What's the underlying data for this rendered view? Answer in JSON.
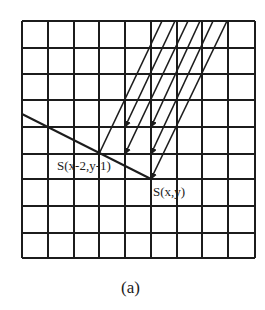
{
  "figure": {
    "caption": "(a)",
    "grid": {
      "rows": 9,
      "cols": 9,
      "x_lines": [
        22,
        48,
        74,
        99,
        125,
        151,
        177,
        202,
        228,
        255
      ],
      "y_lines": [
        21,
        48,
        74,
        100,
        127,
        154,
        179,
        206,
        233,
        258
      ]
    },
    "labels": {
      "point_a": "S(x-2,y-1)",
      "point_b": "S(x,y)"
    },
    "boundary_line": {
      "from": [
        22,
        114
      ],
      "to": [
        151,
        179
      ]
    },
    "direction_lines": [
      {
        "from": [
          162,
          21
        ],
        "to": [
          99,
          154
        ],
        "arrow": false
      },
      {
        "from": [
          175,
          21
        ],
        "to": [
          125,
          127
        ],
        "arrow": true
      },
      {
        "from": [
          188,
          21
        ],
        "to": [
          125,
          154
        ],
        "arrow": true
      },
      {
        "from": [
          200,
          21
        ],
        "to": [
          151,
          127
        ],
        "arrow": true
      },
      {
        "from": [
          213,
          21
        ],
        "to": [
          151,
          154
        ],
        "arrow": true
      },
      {
        "from": [
          227,
          21
        ],
        "to": [
          151,
          179
        ],
        "arrow": true
      }
    ],
    "colors": {
      "ink": "#1c1c1c",
      "background": "#ffffff"
    }
  }
}
